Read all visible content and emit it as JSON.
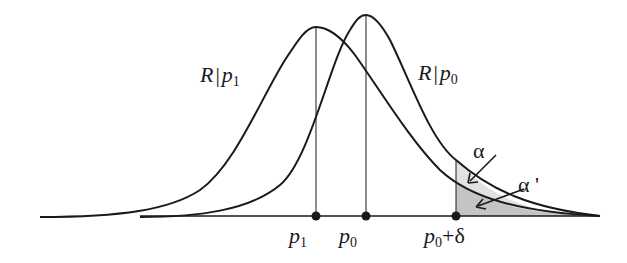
{
  "diagram": {
    "curves": [
      {
        "id": "R_given_p1",
        "label_main": "R",
        "label_bar": "|",
        "label_var": "p",
        "label_sub": "1",
        "mean_label": "p1"
      },
      {
        "id": "R_given_p0",
        "label_main": "R",
        "label_bar": "|",
        "label_var": "p",
        "label_sub": "0",
        "mean_label": "p0"
      }
    ],
    "axis_points": [
      {
        "var": "p",
        "sub": "1",
        "suffix": ""
      },
      {
        "var": "p",
        "sub": "0",
        "suffix": ""
      },
      {
        "var": "p",
        "sub": "0",
        "suffix": "+δ"
      }
    ],
    "annotations": {
      "alpha": "α",
      "alpha_prime": "α '"
    },
    "colors": {
      "line": "#1a1a1a",
      "shade_alpha": "#e2e2e2",
      "shade_alpha_prime": "#c4c4c4"
    }
  }
}
